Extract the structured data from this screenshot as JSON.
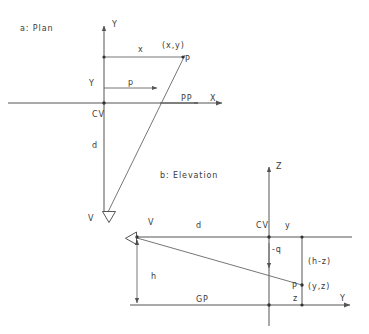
{
  "figure": {
    "title_a": "a:  Plan",
    "title_b": "b:  Elevation",
    "plan": {
      "axis_y_label": "Y",
      "axis_x_label": "X",
      "picture_plane_label": "PP",
      "center_of_vision_label": "CV",
      "viewpoint_label": "V",
      "distance_label": "d",
      "coordinate_y_label": "Y",
      "offset_x_label": "x",
      "projected_p_label": "p",
      "point_label": "P",
      "point_coords": "(x,y)"
    },
    "elevation": {
      "axis_z_label": "Z",
      "axis_y_label": "Y",
      "viewpoint_label": "V",
      "center_of_vision_label": "CV",
      "distance_label": "d",
      "ordinate_label": "y",
      "height_label": "h",
      "ground_plane_label": "GP",
      "projected_q_label": "-q",
      "height_diff_label": "(h-z)",
      "z_label": "z",
      "point_label": "P",
      "point_coords": "(y,z)"
    }
  },
  "colors": {
    "line": "#555555",
    "text": "#3a3a3a",
    "background": "#ffffff"
  }
}
